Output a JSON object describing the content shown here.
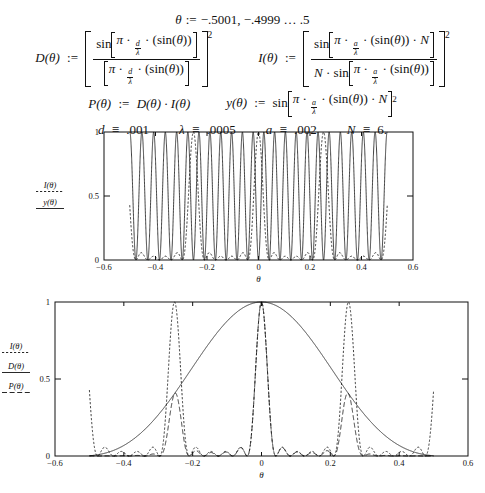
{
  "definitions": {
    "theta_range": {
      "lhs": "θ",
      "op": ":=",
      "rhs": "−.5001, −.4999 … .5"
    },
    "D": {
      "name": "D(θ)",
      "op": ":=",
      "numerator": "sin[π · d/λ · (sin(θ))]",
      "denominator": "[π · d/λ · (sin(θ))]",
      "exponent": "2"
    },
    "I": {
      "name": "I(θ)",
      "op": ":=",
      "numerator": "sin[π · a/λ · (sin(θ)) · N]",
      "denominator": "N · sin[π · a/λ · (sin(θ))]",
      "exponent": "2"
    },
    "P": {
      "name": "P(θ)",
      "op": ":=",
      "rhs": "D(θ) · I(θ)"
    },
    "y": {
      "name": "y(θ)",
      "op": ":=",
      "rhs": "sin[π · a/λ · (sin(θ)) · N]",
      "exponent": "2"
    }
  },
  "parameters": [
    {
      "symbol": "d",
      "op": "≡",
      "value": ".001"
    },
    {
      "symbol": "λ",
      "op": "≡",
      "value": ".0005"
    },
    {
      "symbol": "a",
      "op": "≡",
      "value": ".002"
    },
    {
      "symbol": "N",
      "op": "≡",
      "value": "6."
    }
  ],
  "chart_data": [
    {
      "id": "chart1",
      "type": "line",
      "title": "",
      "xlabel": "θ",
      "ylabel": "",
      "xlim": [
        -0.6,
        0.6
      ],
      "ylim": [
        0,
        1
      ],
      "xticks": [
        -0.6,
        -0.4,
        -0.2,
        0,
        0.2,
        0.4,
        0.6
      ],
      "xticklabels": [
        "−0.6",
        "−0.4",
        "−0.2",
        "0",
        "0.2",
        "0.4",
        "0.6"
      ],
      "yticks": [
        0,
        0.5,
        1
      ],
      "yticklabels": [
        "0",
        "0.5",
        "1"
      ],
      "grid": false,
      "legend_position": "left-outside",
      "series": [
        {
          "name": "I(θ)",
          "style": "dashed",
          "formula": "I"
        },
        {
          "name": "y(θ)",
          "style": "solid",
          "formula": "y"
        }
      ],
      "domain_plotted": [
        -0.5001,
        0.5
      ],
      "constants": {
        "d": 0.001,
        "lambda": 0.0005,
        "a": 0.002,
        "N": 6
      }
    },
    {
      "id": "chart2",
      "type": "line",
      "title": "",
      "xlabel": "θ",
      "ylabel": "",
      "xlim": [
        -0.6,
        0.6
      ],
      "ylim": [
        0,
        1
      ],
      "xticks": [
        -0.6,
        -0.4,
        -0.2,
        0,
        0.2,
        0.4,
        0.6
      ],
      "xticklabels": [
        "−0.6",
        "−0.4",
        "−0.2",
        "0",
        "0.2",
        "0.4",
        "0.6"
      ],
      "yticks": [
        0,
        0.5,
        1
      ],
      "yticklabels": [
        "0",
        "0.5",
        "1"
      ],
      "grid": false,
      "legend_position": "left-outside",
      "series": [
        {
          "name": "I(θ)",
          "style": "dashed",
          "formula": "I"
        },
        {
          "name": "D(θ)",
          "style": "solid",
          "formula": "D"
        },
        {
          "name": "P(θ)",
          "style": "longdash",
          "formula": "P"
        }
      ],
      "domain_plotted": [
        -0.5001,
        0.5
      ],
      "constants": {
        "d": 0.001,
        "lambda": 0.0005,
        "a": 0.002,
        "N": 6
      }
    }
  ]
}
